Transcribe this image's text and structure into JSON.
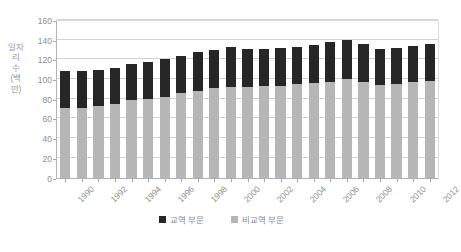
{
  "chart_data": {
    "type": "bar",
    "stacked": true,
    "title": "",
    "xlabel": "",
    "ylabel": "일자리 수 (백만)",
    "ylim": [
      0,
      160
    ],
    "ytick_step": 20,
    "yticks": [
      "160",
      "140",
      "120",
      "100",
      "80",
      "60",
      "40",
      "20",
      "0"
    ],
    "grid": true,
    "legend_position": "bottom",
    "x": [
      1990,
      1991,
      1992,
      1993,
      1994,
      1995,
      1996,
      1997,
      1998,
      1999,
      2000,
      2001,
      2002,
      2003,
      2004,
      2005,
      2006,
      2007,
      2008,
      2009,
      2010,
      2011,
      2012
    ],
    "categories": [
      "1990",
      "1991",
      "1992",
      "1993",
      "1994",
      "1995",
      "1996",
      "1997",
      "1998",
      "1999",
      "2000",
      "2001",
      "2002",
      "2003",
      "2004",
      "2005",
      "2006",
      "2007",
      "2008",
      "2009",
      "2010",
      "2011",
      "2012"
    ],
    "visible_tick_labels": [
      "1990",
      "1992",
      "1994",
      "1996",
      "1998",
      "2000",
      "2002",
      "2004",
      "2006",
      "2008",
      "2010",
      "2012"
    ],
    "series": [
      {
        "name": "비교역 부문",
        "color": "#b6b6b6",
        "stack_order": "bottom",
        "values": [
          71,
          71,
          73,
          75,
          79,
          80,
          82.5,
          86,
          88.5,
          91,
          92,
          92.5,
          93.5,
          93.5,
          95.5,
          96.5,
          98,
          101,
          98,
          94.5,
          95,
          98,
          99
        ]
      },
      {
        "name": "교역 부문",
        "color": "#262626",
        "stack_order": "top",
        "values": [
          37.5,
          37.5,
          37,
          37,
          36.5,
          37.5,
          38.5,
          38,
          39.5,
          39,
          41.5,
          39,
          38,
          38.5,
          38,
          39,
          40,
          39,
          38.5,
          36.5,
          37.5,
          36.5,
          37
        ]
      }
    ],
    "totals": [
      108.5,
      108.5,
      110,
      112,
      115.5,
      117.5,
      121,
      124,
      128,
      130,
      133.5,
      131.5,
      131.5,
      132,
      133.5,
      135.5,
      138,
      140,
      136.5,
      131,
      132.5,
      134.5,
      136
    ]
  },
  "legend": {
    "items": [
      {
        "label": "교역 부문",
        "color": "#262626",
        "swatch_name": "legend-swatch-trade"
      },
      {
        "label": "비교역 부문",
        "color": "#b6b6b6",
        "swatch_name": "legend-swatch-nontrade"
      }
    ]
  },
  "axis": {
    "y_title": "일자리 수 (백만)"
  },
  "colors": {
    "trade": "#262626",
    "nontrade": "#b6b6b6",
    "grid": "#d2d2d2",
    "axis": "#b0b0b0",
    "text": "#8f8f8f",
    "background": "#ffffff"
  }
}
